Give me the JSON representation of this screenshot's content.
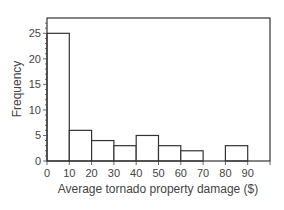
{
  "chart_data": {
    "type": "bar",
    "subtype": "histogram",
    "title": "",
    "xlabel": "Average tornado property damage ($)",
    "ylabel": "Frequency",
    "bins": [
      [
        0,
        10
      ],
      [
        10,
        20
      ],
      [
        20,
        30
      ],
      [
        30,
        40
      ],
      [
        40,
        50
      ],
      [
        50,
        60
      ],
      [
        60,
        70
      ],
      [
        70,
        80
      ],
      [
        80,
        90
      ]
    ],
    "categories": [
      "0-10",
      "10-20",
      "20-30",
      "30-40",
      "40-50",
      "50-60",
      "60-70",
      "70-80",
      "80-90"
    ],
    "values": [
      25,
      6,
      4,
      3,
      5,
      3,
      2,
      0,
      3
    ],
    "xlim": [
      0,
      100
    ],
    "ylim": [
      0,
      28
    ],
    "x_ticks": [
      "0",
      "10",
      "20",
      "30",
      "40",
      "50",
      "60",
      "70",
      "80",
      "90"
    ],
    "y_ticks": [
      "0",
      "5",
      "10",
      "15",
      "20",
      "25"
    ],
    "grid": false,
    "legend": null
  }
}
